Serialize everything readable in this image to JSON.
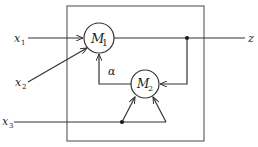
{
  "diagram": {
    "inputs": [
      {
        "name": "x",
        "sub": "1"
      },
      {
        "name": "x",
        "sub": "2"
      },
      {
        "name": "x",
        "sub": "3"
      }
    ],
    "output": {
      "name": "z"
    },
    "nodes": [
      {
        "name": "M",
        "sub": "1"
      },
      {
        "name": "M",
        "sub": "2"
      }
    ],
    "edge_labels": {
      "feedback": "α"
    },
    "colors": {
      "stroke": "#333333",
      "box": "#666666",
      "background": "#ffffff"
    }
  }
}
